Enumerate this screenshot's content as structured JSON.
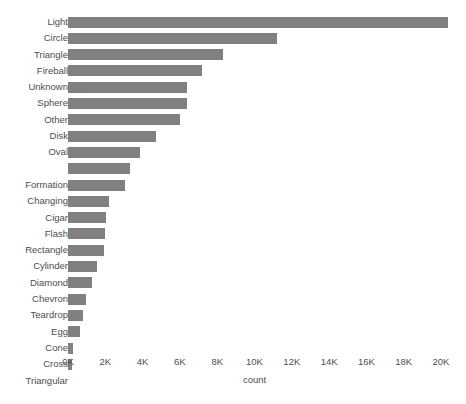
{
  "chart_data": {
    "type": "bar",
    "orientation": "horizontal",
    "title": "",
    "xlabel": "count",
    "ylabel": "",
    "xlim": [
      0,
      20000
    ],
    "xticks": [
      0,
      2000,
      4000,
      6000,
      8000,
      10000,
      12000,
      14000,
      16000,
      18000,
      20000
    ],
    "xticklabels": [
      "0K",
      "2K",
      "4K",
      "6K",
      "8K",
      "10K",
      "12K",
      "14K",
      "16K",
      "18K",
      "20K"
    ],
    "grid": false,
    "legend": false,
    "bar_color": "#808080",
    "text_color": "#4d4d4d",
    "background": "#ffffff",
    "categories": [
      "Light",
      "Circle",
      "Triangle",
      "Fireball",
      "Unknown",
      "Sphere",
      "Other",
      "Disk",
      "Oval",
      "",
      "Formation",
      "Changing",
      "Cigar",
      "Flash",
      "Rectangle",
      "Cylinder",
      "Diamond",
      "Chevron",
      "Teardrop",
      "Egg",
      "Cone",
      "Cross",
      "Triangular"
    ],
    "values": [
      20400,
      11200,
      8300,
      7200,
      6400,
      6400,
      6000,
      4700,
      3850,
      3300,
      3050,
      2200,
      2050,
      2000,
      1950,
      1550,
      1300,
      950,
      800,
      650,
      280,
      240,
      0
    ]
  }
}
